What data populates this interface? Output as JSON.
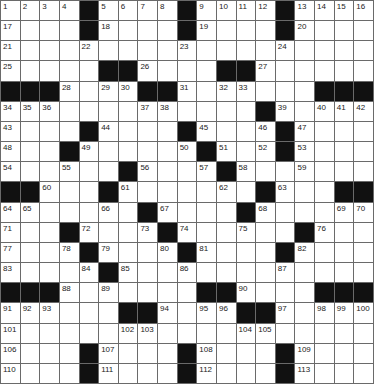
{
  "puzzle": {
    "rows": 19,
    "cols": 19,
    "colors": {
      "black": "#111111",
      "white": "#ffffff",
      "line": "#6a6a6a",
      "number": "#222222"
    },
    "grid": [
      [
        "1",
        "2",
        "3",
        "4",
        "#",
        "5",
        "6",
        "7",
        "8",
        "#",
        "9",
        "10",
        "11",
        "12",
        "#",
        "13",
        "14",
        "15",
        "16"
      ],
      [
        "17",
        ".",
        ".",
        ".",
        "#",
        "18",
        ".",
        ".",
        ".",
        "#",
        "19",
        ".",
        ".",
        ".",
        "#",
        "20",
        ".",
        ".",
        "."
      ],
      [
        "21",
        ".",
        ".",
        ".",
        "22",
        ".",
        ".",
        ".",
        ".",
        "23",
        ".",
        ".",
        ".",
        ".",
        "24",
        ".",
        ".",
        ".",
        "."
      ],
      [
        "25",
        ".",
        ".",
        ".",
        ".",
        "#",
        "#",
        "26",
        ".",
        ".",
        ".",
        "#",
        "#",
        "27",
        ".",
        ".",
        ".",
        ".",
        "."
      ],
      [
        "#",
        "#",
        "#",
        "28",
        ".",
        "29",
        "30",
        "#",
        "#",
        "31",
        ".",
        "32",
        "33",
        ".",
        ".",
        ".",
        "#",
        "#",
        "#"
      ],
      [
        "34",
        "35",
        "36",
        ".",
        ".",
        ".",
        ".",
        "37",
        "38",
        ".",
        ".",
        ".",
        ".",
        "#",
        "39",
        ".",
        "40",
        "41",
        "42"
      ],
      [
        "43",
        ".",
        ".",
        ".",
        "#",
        "44",
        ".",
        ".",
        ".",
        "#",
        "45",
        ".",
        ".",
        "46",
        "#",
        "47",
        ".",
        ".",
        "."
      ],
      [
        "48",
        ".",
        ".",
        "#",
        "49",
        ".",
        ".",
        ".",
        ".",
        "50",
        "#",
        "51",
        ".",
        "52",
        "#",
        "53",
        ".",
        ".",
        "."
      ],
      [
        "54",
        ".",
        ".",
        "55",
        ".",
        ".",
        "#",
        "56",
        ".",
        ".",
        "57",
        "#",
        "58",
        ".",
        ".",
        "59",
        ".",
        ".",
        "."
      ],
      [
        "#",
        "#",
        "60",
        ".",
        ".",
        "#",
        "61",
        ".",
        ".",
        ".",
        ".",
        "62",
        ".",
        "#",
        "63",
        ".",
        ".",
        "#",
        "#"
      ],
      [
        "64",
        "65",
        ".",
        ".",
        ".",
        "66",
        ".",
        "#",
        "67",
        ".",
        ".",
        ".",
        "#",
        "68",
        ".",
        ".",
        ".",
        "69",
        "70"
      ],
      [
        "71",
        ".",
        ".",
        "#",
        "72",
        ".",
        ".",
        "73",
        "#",
        "74",
        ".",
        ".",
        "75",
        ".",
        ".",
        "#",
        "76",
        ".",
        "."
      ],
      [
        "77",
        ".",
        ".",
        "78",
        "#",
        "79",
        ".",
        ".",
        "80",
        "#",
        "81",
        ".",
        ".",
        ".",
        "#",
        "82",
        ".",
        ".",
        "."
      ],
      [
        "83",
        ".",
        ".",
        ".",
        "84",
        "#",
        "85",
        ".",
        ".",
        "86",
        ".",
        ".",
        ".",
        ".",
        "87",
        ".",
        ".",
        ".",
        "."
      ],
      [
        "#",
        "#",
        "#",
        "88",
        ".",
        "89",
        ".",
        ".",
        ".",
        ".",
        "#",
        "#",
        "90",
        ".",
        ".",
        ".",
        "#",
        "#",
        "#"
      ],
      [
        "91",
        "92",
        "93",
        ".",
        ".",
        ".",
        "#",
        "#",
        "94",
        ".",
        "95",
        "96",
        "#",
        "#",
        "97",
        ".",
        "98",
        "99",
        "100"
      ],
      [
        "101",
        ".",
        ".",
        ".",
        ".",
        ".",
        "102",
        "103",
        ".",
        ".",
        ".",
        ".",
        "104",
        "105",
        ".",
        ".",
        ".",
        ".",
        "."
      ],
      [
        "106",
        ".",
        ".",
        ".",
        "#",
        "107",
        ".",
        ".",
        ".",
        "#",
        "108",
        ".",
        ".",
        ".",
        "#",
        "109",
        ".",
        ".",
        "."
      ],
      [
        "110",
        ".",
        ".",
        ".",
        "#",
        "111",
        ".",
        ".",
        ".",
        "#",
        "112",
        ".",
        ".",
        ".",
        "#",
        "113",
        ".",
        ".",
        "."
      ]
    ]
  }
}
